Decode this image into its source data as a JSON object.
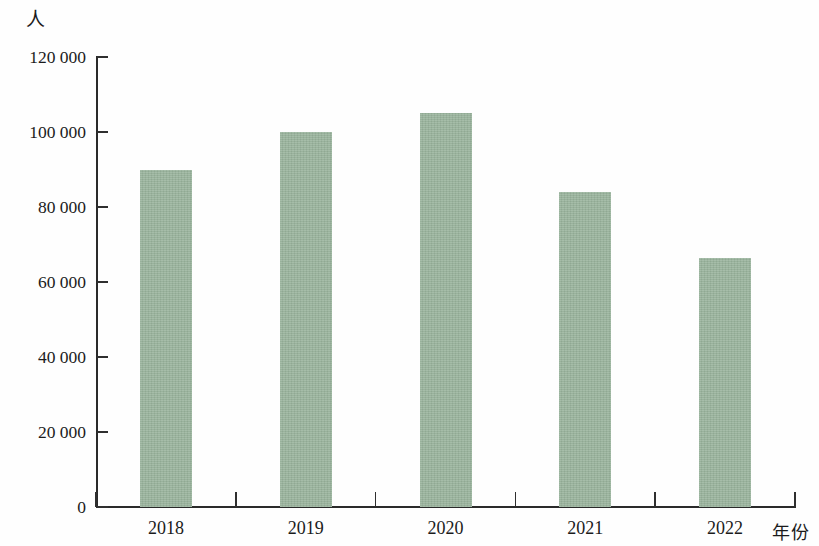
{
  "chart_data": {
    "type": "bar",
    "title": "",
    "subtitle": "",
    "xlabel": "年份",
    "ylabel": "人",
    "categories": [
      "2018",
      "2019",
      "2020",
      "2021",
      "2022"
    ],
    "values": [
      90000,
      100000,
      105000,
      84000,
      66500
    ],
    "series": [
      {
        "name": "",
        "values": [
          90000,
          100000,
          105000,
          84000,
          66500
        ]
      }
    ],
    "ylim": [
      0,
      120000
    ],
    "y_ticks": [
      0,
      20000,
      40000,
      60000,
      80000,
      100000,
      120000
    ],
    "y_tick_labels": [
      "0",
      "20 000",
      "40 000",
      "60 000",
      "80 000",
      "100 000",
      "120 000"
    ],
    "x_tick_labels": [
      "2018",
      "2019",
      "2020",
      "2021",
      "2022"
    ],
    "grid": false,
    "legend": null,
    "legend_position": "none",
    "bar_color": "#9ab49d",
    "axis_color": "#2a2a2a",
    "annotations": []
  },
  "axes": {
    "y_title": "人",
    "x_title": "年份"
  }
}
